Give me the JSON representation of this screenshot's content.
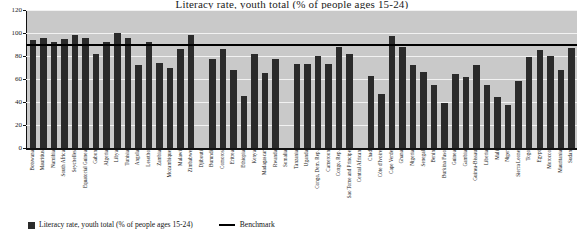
{
  "title_sliver": "Literacy rate, youth total (% of people ages 15-24)",
  "legend": {
    "series_label": "Literacy rate, youth total (% of people ages 15-24)",
    "benchmark_label": "Benchmark",
    "series_color": "#2b2b2b",
    "benchmark_color": "#000000"
  },
  "axis": {
    "y_ticks": [
      "0",
      "20",
      "40",
      "60",
      "80",
      "100",
      "120"
    ]
  },
  "chart_data": {
    "type": "bar",
    "title": "Literacy rate, youth total (% of people ages 15-24)",
    "xlabel": "",
    "ylabel": "",
    "ylim": [
      0,
      120
    ],
    "yticks": [
      0,
      20,
      40,
      60,
      80,
      100,
      120
    ],
    "grid": true,
    "legend_position": "bottom-left",
    "benchmark": 90,
    "series_name": "Literacy rate, youth total (% of people ages 15-24)",
    "categories": [
      "Botswana",
      "Mauritius",
      "Namibia",
      "South Africa",
      "Seychelles",
      "Equatorial Guinea",
      "Gabon",
      "Algeria",
      "Libya",
      "Tunisia",
      "Angola",
      "Lesotho",
      "Zambia",
      "Mozambique",
      "Malawi",
      "Zimbabwe",
      "Djibouti",
      "Burundi",
      "Comoros",
      "Eritrea",
      "Ethiopia",
      "Kenya",
      "Madagascar",
      "Rwanda",
      "Somalia",
      "Tanzania",
      "Uganda",
      "Congo, Dem. Rep.",
      "Cameroon",
      "Congo, Rep.",
      "Sao Tome and Principe",
      "Central African",
      "Chad",
      "Côte d'Ivoire",
      "Cape Verde",
      "Ghana",
      "Nigeria",
      "Senegal",
      "Benin",
      "Burkina Faso",
      "Guinea",
      "Gambia",
      "Guinea-Bissau",
      "Liberia",
      "Mali",
      "Niger",
      "Sierra Leone",
      "Togo",
      "Egypt",
      "Morocco",
      "Mauritania",
      "Sudan"
    ],
    "values": [
      94,
      96,
      92,
      95,
      98,
      96,
      82,
      92,
      100,
      96,
      72,
      92,
      74,
      70,
      86,
      98,
      null,
      77,
      86,
      68,
      45,
      82,
      65,
      77,
      null,
      73,
      73,
      80,
      73,
      88,
      82,
      null,
      63,
      47,
      97,
      88,
      72,
      66,
      55,
      39,
      64,
      62,
      72,
      55,
      44,
      37,
      58,
      79,
      85,
      80,
      68,
      87
    ]
  }
}
